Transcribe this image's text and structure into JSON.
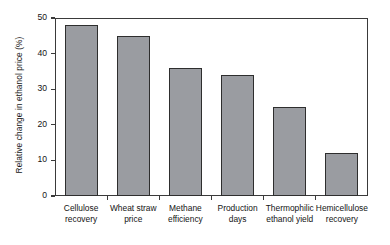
{
  "chart_data": {
    "type": "bar",
    "title": "",
    "xlabel": "",
    "ylabel": "Relative change in ethanol price (%)",
    "ylim": [
      0,
      50
    ],
    "yticks": [
      0,
      10,
      20,
      30,
      40,
      50
    ],
    "ytick_labels": [
      "0",
      "10",
      "20",
      "30",
      "40",
      "50"
    ],
    "grid": false,
    "legend": false,
    "categories": [
      "Cellulose recovery",
      "Wheat straw price",
      "Methane efficiency",
      "Production days",
      "Thermophilic ethanol yield",
      "Hemicellulose recovery"
    ],
    "category_lines": [
      [
        "Cellulose",
        "recovery"
      ],
      [
        "Wheat straw",
        "price"
      ],
      [
        "Methane",
        "efficiency"
      ],
      [
        "Production",
        "days"
      ],
      [
        "Thermophilic",
        "ethanol yield"
      ],
      [
        "Hemicellulose",
        "recovery"
      ]
    ],
    "values": [
      48,
      45,
      36,
      34,
      25,
      12
    ],
    "bar_color": "#9a9ca1",
    "bar_edge_color": "#2e2e2e",
    "axis_color": "#3a3a3a",
    "background_color": "#ffffff"
  }
}
